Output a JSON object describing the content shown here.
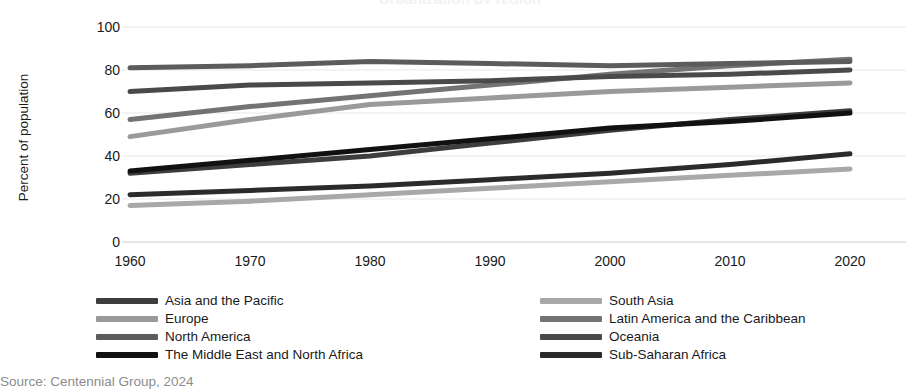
{
  "chart_data": {
    "type": "line",
    "title": "Urbanization by region",
    "xlabel": "",
    "ylabel": "Percent of population",
    "x": [
      1960,
      1970,
      1980,
      1990,
      2000,
      2010,
      2020
    ],
    "xtick_labels": [
      "1960",
      "1970",
      "1980",
      "1990",
      "2000",
      "2010",
      "2020"
    ],
    "ytick_labels": [
      "0",
      "20",
      "40",
      "60",
      "80",
      "100"
    ],
    "yticks": [
      0,
      20,
      40,
      60,
      80,
      100
    ],
    "ylim": [
      0,
      100
    ],
    "xlim": [
      1960,
      2020
    ],
    "grid": true,
    "grid_axis": "y",
    "legend_position": "bottom",
    "legend_columns": 2,
    "series": [
      {
        "name": "Asia and the Pacific",
        "color": "#3d3d3d",
        "values": [
          32,
          36,
          40,
          46,
          52,
          57,
          61
        ]
      },
      {
        "name": "South Asia",
        "color": "#a8a8a8",
        "values": [
          17,
          19,
          22,
          25,
          28,
          31,
          34
        ]
      },
      {
        "name": "Europe",
        "color": "#9a9a9a",
        "values": [
          49,
          57,
          64,
          67,
          70,
          72,
          74
        ]
      },
      {
        "name": "Latin America and the Caribbean",
        "color": "#737373",
        "values": [
          57,
          63,
          68,
          73,
          78,
          82,
          85
        ]
      },
      {
        "name": "North America",
        "color": "#5c5c5c",
        "values": [
          81,
          82,
          84,
          83,
          82,
          83,
          84
        ]
      },
      {
        "name": "Oceania",
        "color": "#4a4a4a",
        "values": [
          70,
          73,
          74,
          75,
          77,
          78,
          80
        ]
      },
      {
        "name": "The Middle East and North Africa",
        "color": "#111111",
        "values": [
          33,
          38,
          43,
          48,
          53,
          56,
          60
        ]
      },
      {
        "name": "Sub-Saharan Africa",
        "color": "#2b2b2b",
        "values": [
          22,
          24,
          26,
          29,
          32,
          36,
          41
        ]
      }
    ]
  },
  "source": {
    "text": "Source: Centennial Group, 2024"
  }
}
